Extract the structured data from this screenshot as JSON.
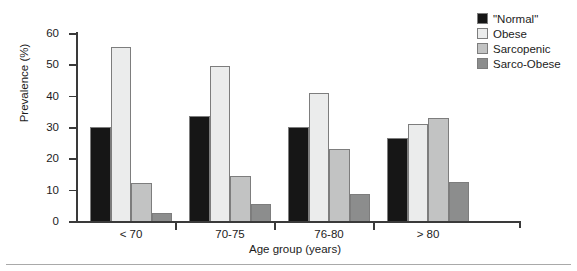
{
  "chart_data": {
    "type": "bar",
    "title": "",
    "xlabel": "Age group (years)",
    "ylabel": "Prevalence (%)",
    "categories": [
      "< 70",
      "70-75",
      "76-80",
      "> 80"
    ],
    "ylim": [
      0,
      60
    ],
    "yticks": [
      0,
      10,
      20,
      30,
      40,
      50,
      60
    ],
    "ytick_labels": [
      "0",
      "10",
      "20",
      "30",
      "40",
      "50",
      "60"
    ],
    "grid": false,
    "legend_position": "top-right",
    "series": [
      {
        "name": "\"Normal\"",
        "color": "#161616",
        "values": [
          30.0,
          33.5,
          30.0,
          26.5
        ]
      },
      {
        "name": "Obese",
        "color": "#ebecec",
        "values": [
          55.5,
          49.5,
          41.0,
          31.0
        ]
      },
      {
        "name": "Sarcopenic",
        "color": "#c2c3c3",
        "values": [
          12.0,
          14.5,
          23.0,
          33.0
        ]
      },
      {
        "name": "Sarco-Obese",
        "color": "#8c8d8d",
        "values": [
          2.5,
          5.5,
          8.5,
          12.5
        ]
      }
    ]
  },
  "axis": {
    "edge_color": "#3a3a3a",
    "bar_edge_color": "#7d7d7d"
  }
}
